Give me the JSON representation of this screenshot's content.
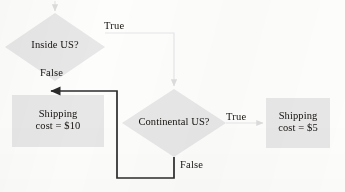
{
  "diagram": {
    "palette": {
      "node_fill": "#e6e6e6",
      "node_fill_light": "#ebebeb",
      "text": "#15120f",
      "edge_strong": "#2b2b2b",
      "edge_faint": "#e3e3e3",
      "background": "#fdfdfc"
    },
    "nodes": [
      {
        "id": "inside-us",
        "shape": "diamond",
        "label": "Inside US?"
      },
      {
        "id": "continental-us",
        "shape": "diamond",
        "label": "Continental US?"
      },
      {
        "id": "shipping-10",
        "shape": "rectangle",
        "label": "Shipping\ncost = $10"
      },
      {
        "id": "shipping-5",
        "shape": "rectangle",
        "label": "Shipping\ncost = $5"
      }
    ],
    "edges": [
      {
        "id": "entry-to-inside-us",
        "from": "",
        "to": "inside-us",
        "label": "",
        "style": "faint"
      },
      {
        "id": "inside-us-true",
        "from": "inside-us",
        "to": "continental-us",
        "label": "True",
        "style": "faint"
      },
      {
        "id": "inside-us-false",
        "from": "inside-us",
        "to": "shipping-10",
        "label": "False",
        "style": "strong"
      },
      {
        "id": "continental-us-true",
        "from": "continental-us",
        "to": "shipping-5",
        "label": "True",
        "style": "faint"
      },
      {
        "id": "continental-us-false",
        "from": "continental-us",
        "to": "shipping-10",
        "label": "False",
        "style": "strong"
      }
    ]
  }
}
